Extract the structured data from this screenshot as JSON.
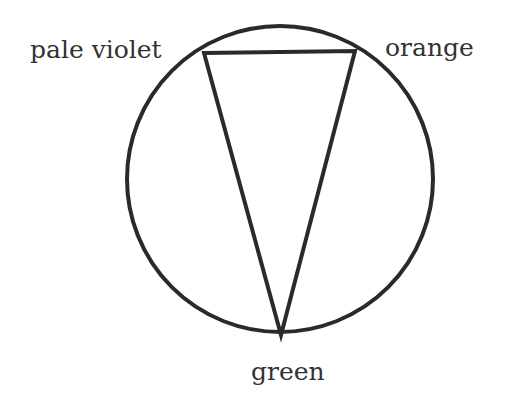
{
  "diagram": {
    "type": "inscribed-triangle-color-wheel",
    "circle": {
      "cx": 280,
      "cy": 179,
      "r": 153,
      "stroke": "#2a2a2a"
    },
    "vertices": [
      {
        "name": "pale violet",
        "label": "pale violet",
        "x": 204,
        "y": 53
      },
      {
        "name": "orange",
        "label": "orange",
        "x": 355,
        "y": 51
      },
      {
        "name": "green",
        "label": "green",
        "x": 281,
        "y": 335
      }
    ],
    "line_color": "#2a2a2a"
  }
}
